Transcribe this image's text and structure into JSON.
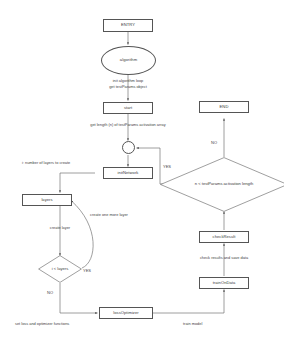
{
  "diagram": {
    "type": "flowchart",
    "stroke_color": "#555555",
    "text_color": "#3a3a3a",
    "background": "#ffffff",
    "nodes": {
      "entry": {
        "label": "ENTRY",
        "shape": "rectangle"
      },
      "algorithm": {
        "label": "algorithm",
        "shape": "ellipse"
      },
      "start": {
        "label": "start",
        "shape": "rectangle"
      },
      "end": {
        "label": "END",
        "shape": "rectangle"
      },
      "junction": {
        "label": "",
        "shape": "circle"
      },
      "condition_n": {
        "label": "n < testParams activation length",
        "shape": "diamond"
      },
      "init_network": {
        "label": "initNetwork",
        "shape": "rectangle"
      },
      "layers": {
        "label": "layers",
        "shape": "rectangle"
      },
      "condition_i": {
        "label": "i < layers",
        "shape": "diamond"
      },
      "loss_optimizer": {
        "label": "lossOptimizer",
        "shape": "rectangle"
      },
      "train_on_data": {
        "label": "trainOnData",
        "shape": "rectangle"
      },
      "check_result": {
        "label": "checkResult",
        "shape": "rectangle"
      }
    },
    "edge_labels": {
      "algorithm_to_start_line1": "init algorithm loop",
      "algorithm_to_start_line2": "get testParams object",
      "start_to_junction": "get length (n) of testParams activation array",
      "init_to_layers": "i: number of layers to create",
      "layers_to_condition": "create layer",
      "condition_i_back_to_layers": "create one more layer",
      "to_loss_optimizer": "set loss and optimizer functions",
      "loss_optimizer_to_train": "train model",
      "train_to_check": "check results and save data"
    },
    "branch_labels": {
      "condition_n_yes": "YES",
      "condition_n_no": "NO",
      "condition_i_yes": "YES",
      "condition_i_no": "NO"
    }
  }
}
